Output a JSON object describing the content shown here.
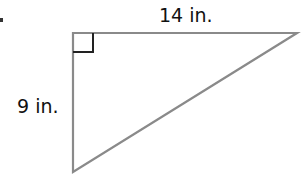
{
  "diagram": {
    "type": "right-triangle",
    "labels": {
      "top_side": "14 in.",
      "left_side": "9 in."
    },
    "colors": {
      "stroke": "#8a8a8a",
      "right_angle_marker": "#222222",
      "text": "#111111"
    }
  }
}
